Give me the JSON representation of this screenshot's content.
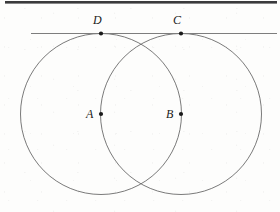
{
  "figure": {
    "canvas": {
      "width": 280,
      "height": 212,
      "background": "#fdfdfc"
    },
    "stroke_color": "#6b6b6b",
    "dot_color": "#1a1a1a",
    "label_color": "#1a1a1a",
    "top_bar": {
      "name": "scan-edge-bar",
      "color": "#3a3a3c",
      "x": 5,
      "y": 1,
      "width": 272,
      "height": 2.6
    },
    "tangent_line": {
      "name": "tangent-line-DC",
      "x1": 31,
      "y1": 33.5,
      "x2": 277,
      "y2": 33.5,
      "color": "#7d7d7d",
      "width": 1
    },
    "circles": [
      {
        "id": "circle-A",
        "label": "A",
        "cx": 101,
        "cy": 114,
        "r": 80.5,
        "color": "#6b6b6b",
        "width": 0.9
      },
      {
        "id": "circle-B",
        "label": "B",
        "cx": 181,
        "cy": 114,
        "r": 80.5,
        "color": "#6b6b6b",
        "width": 0.9
      }
    ],
    "points": [
      {
        "id": "point-D",
        "label": "D",
        "x": 101,
        "y": 33.5,
        "r": 2.1,
        "label_x": 93,
        "label_y": 14,
        "label_anchor": "above-left"
      },
      {
        "id": "point-C",
        "label": "C",
        "x": 181,
        "y": 33.5,
        "r": 2.1,
        "label_x": 173,
        "label_y": 14,
        "label_anchor": "above-left"
      },
      {
        "id": "point-A",
        "label": "A",
        "x": 101,
        "y": 114,
        "r": 2.1,
        "label_x": 86,
        "label_y": 108,
        "label_anchor": "left"
      },
      {
        "id": "point-B",
        "label": "B",
        "x": 181,
        "y": 114,
        "r": 2.1,
        "label_x": 166,
        "label_y": 108,
        "label_anchor": "left"
      }
    ]
  }
}
